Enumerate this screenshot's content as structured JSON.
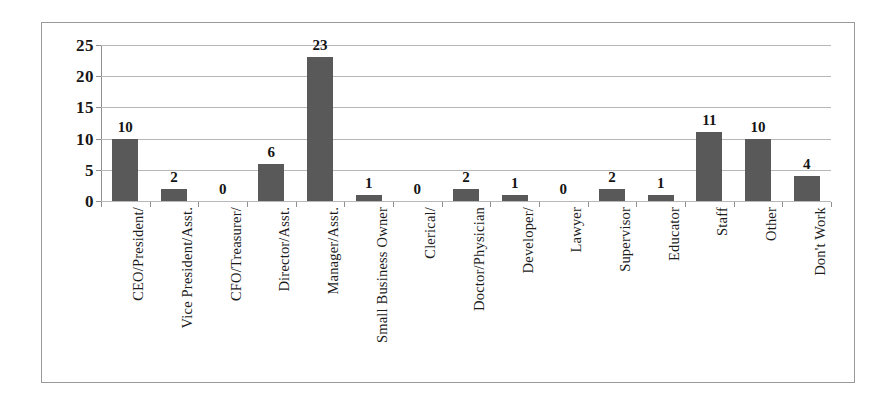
{
  "chart_data": {
    "type": "bar",
    "title": "",
    "subtitle": "",
    "xlabel": "",
    "ylabel": "",
    "ylim": [
      0,
      25
    ],
    "yticks": [
      0,
      5,
      10,
      15,
      20,
      25
    ],
    "grid": true,
    "legend": false,
    "legend_position": "none",
    "orientation": "vertical",
    "bar_color": "#595959",
    "categories": [
      "CEO/President/",
      "Vice President/Asst.",
      "CFO/Treasurer/",
      "Director/Asst.",
      "Manager/Asst.",
      "Small Business Owner",
      "Clerical/",
      "Doctor/Physician",
      "Developer/",
      "Lawyer",
      "Supervisor",
      "Educator",
      "Staff",
      "Other",
      "Don't Work"
    ],
    "values": [
      10,
      2,
      0,
      6,
      23,
      1,
      0,
      2,
      1,
      0,
      2,
      1,
      11,
      10,
      4
    ],
    "data_labels": [
      "10",
      "2",
      "0",
      "6",
      "23",
      "1",
      "0",
      "2",
      "1",
      "0",
      "2",
      "1",
      "11",
      "10",
      "4"
    ],
    "ytick_labels": [
      "0",
      "5",
      "10",
      "15",
      "20",
      "25"
    ]
  }
}
